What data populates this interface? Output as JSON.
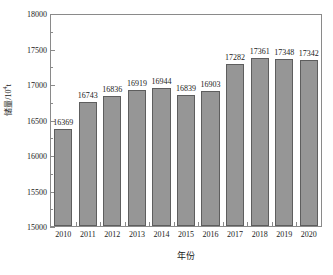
{
  "chart_data": {
    "type": "bar",
    "title": "",
    "xlabel": "年份",
    "ylabel": "储量/10⁴t",
    "ylabel_base": "储量/10",
    "ylabel_exp": "4",
    "ylabel_unit": "t",
    "categories": [
      "2010",
      "2011",
      "2012",
      "2013",
      "2014",
      "2015",
      "2016",
      "2017",
      "2018",
      "2019",
      "2020"
    ],
    "values": [
      16369,
      16743,
      16836,
      16919,
      16944,
      16839,
      16903,
      17282,
      17361,
      17348,
      17342
    ],
    "value_labels": [
      "16369",
      "16743",
      "16836",
      "16919",
      "16944",
      "16839",
      "16903",
      "17282",
      "17361",
      "17348",
      "17342"
    ],
    "ylim": [
      15000,
      18000
    ],
    "ytick_values": [
      15000,
      15500,
      16000,
      16500,
      17000,
      17500,
      18000
    ],
    "ytick_labels": [
      "15000",
      "15500",
      "16000",
      "16500",
      "17000",
      "17500",
      "18000"
    ],
    "yminor_values": [
      15250,
      15750,
      16250,
      16750,
      17250,
      17750
    ],
    "grid": false,
    "legend": null,
    "bar_color": "#969696",
    "bar_edge_color": "#5e5e5e",
    "axis_color": "#8a8a8a",
    "text_color": "#1a1a1a",
    "background": "#ffffff"
  }
}
